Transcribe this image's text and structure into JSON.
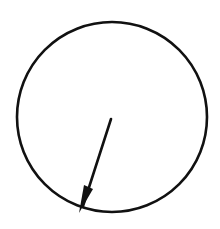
{
  "diagram": {
    "type": "circle-with-radius",
    "stroke_color": "#111111",
    "background": "#ffffff",
    "circle": {
      "cx": 112,
      "cy": 117,
      "r": 95
    },
    "radius_arrow": {
      "from": [
        111,
        119
      ],
      "to": [
        82,
        210
      ]
    }
  }
}
